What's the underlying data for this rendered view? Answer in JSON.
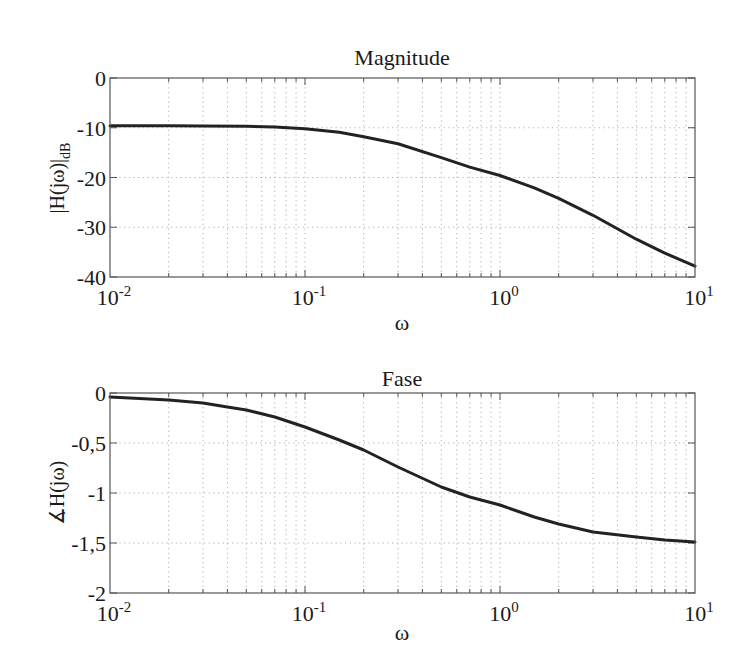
{
  "chart_data": [
    {
      "type": "line",
      "title": "Magnitude",
      "xlabel": "ω",
      "ylabel": "|H(jω)|",
      "ylabel_subscript": "dB",
      "xscale": "log",
      "xlim": [
        0.01,
        10
      ],
      "ylim": [
        -40,
        0
      ],
      "grid": true,
      "x_ticks": [
        {
          "value": 0.01,
          "base": "10",
          "exp": "-2"
        },
        {
          "value": 0.1,
          "base": "10",
          "exp": "-1"
        },
        {
          "value": 1,
          "base": "10",
          "exp": "0"
        },
        {
          "value": 10,
          "base": "10",
          "exp": "1"
        }
      ],
      "y_ticks": [
        {
          "value": 0,
          "label": "0"
        },
        {
          "value": -10,
          "label": "-10"
        },
        {
          "value": -20,
          "label": "-20"
        },
        {
          "value": -30,
          "label": "-30"
        },
        {
          "value": -40,
          "label": "-40"
        }
      ],
      "series": [
        {
          "name": "|H(jω)| dB",
          "x": [
            0.01,
            0.02,
            0.03,
            0.05,
            0.07,
            0.1,
            0.15,
            0.2,
            0.3,
            0.5,
            0.7,
            1,
            1.5,
            2,
            3,
            5,
            7,
            10
          ],
          "y": [
            -9.6,
            -9.6,
            -9.65,
            -9.7,
            -9.85,
            -10.2,
            -10.9,
            -11.8,
            -13.2,
            -16.0,
            -17.9,
            -19.6,
            -22.1,
            -24.2,
            -27.6,
            -32.4,
            -35.2,
            -37.8
          ]
        }
      ]
    },
    {
      "type": "line",
      "title": "Fase",
      "xlabel": "ω",
      "ylabel": "∡H(jω)",
      "xscale": "log",
      "xlim": [
        0.01,
        10
      ],
      "ylim": [
        -2,
        0
      ],
      "grid": true,
      "x_ticks": [
        {
          "value": 0.01,
          "base": "10",
          "exp": "-2"
        },
        {
          "value": 0.1,
          "base": "10",
          "exp": "-1"
        },
        {
          "value": 1,
          "base": "10",
          "exp": "0"
        },
        {
          "value": 10,
          "base": "10",
          "exp": "1"
        }
      ],
      "y_ticks": [
        {
          "value": 0,
          "label": "0"
        },
        {
          "value": -0.5,
          "label": "-0,5"
        },
        {
          "value": -1,
          "label": "-1"
        },
        {
          "value": -1.5,
          "label": "-1,5"
        },
        {
          "value": -2,
          "label": "-2"
        }
      ],
      "series": [
        {
          "name": "∡H(jω)",
          "x": [
            0.01,
            0.02,
            0.03,
            0.04,
            0.05,
            0.07,
            0.1,
            0.15,
            0.2,
            0.3,
            0.5,
            0.7,
            1,
            1.5,
            2,
            3,
            5,
            7,
            10
          ],
          "y": [
            -0.04,
            -0.07,
            -0.1,
            -0.14,
            -0.17,
            -0.24,
            -0.34,
            -0.47,
            -0.57,
            -0.74,
            -0.94,
            -1.04,
            -1.12,
            -1.24,
            -1.31,
            -1.39,
            -1.44,
            -1.47,
            -1.49
          ]
        }
      ]
    }
  ],
  "style": {
    "line_color": "#222222",
    "axis_color": "#555555",
    "grid_color": "#9a9a9a"
  }
}
